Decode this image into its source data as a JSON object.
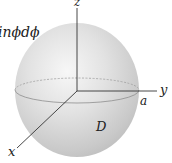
{
  "figure": {
    "formula_fragment": "inϕdϕ",
    "axes": {
      "x_label": "x",
      "y_label": "y",
      "z_label": "z"
    },
    "radius_label": "a",
    "region_label": "D"
  },
  "colors": {
    "sphere_light": "#f4f4f4",
    "sphere_mid": "#d6d6d6",
    "sphere_dark": "#b8b8b8",
    "axis": "#333333",
    "equator_back": "#9a9a9a",
    "equator_front": "#8a8a8a"
  }
}
